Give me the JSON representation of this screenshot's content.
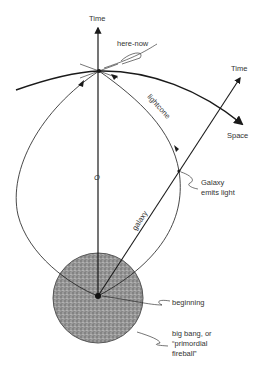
{
  "diagram": {
    "labels": {
      "time_vertical": "Time",
      "here_now": "here-now",
      "time_tilted": "Time",
      "space": "Space",
      "lightcone": "lightcone",
      "origin": "O",
      "galaxy_emits_1": "Galaxy",
      "galaxy_emits_2": "emits light",
      "galaxy": "galaxy",
      "beginning": "beginning",
      "big_bang_1": "big bang, or",
      "big_bang_2": "“primordial",
      "big_bang_3": "fireball”"
    },
    "colors": {
      "ink": "#1a1a1a",
      "text": "#333333",
      "fireball_fill": "#8a8a8a"
    }
  }
}
